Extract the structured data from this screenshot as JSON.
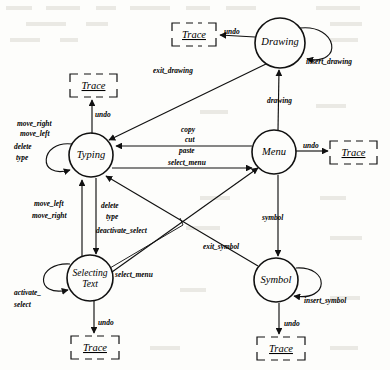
{
  "diagram": {
    "type": "state-machine",
    "states": [
      {
        "id": "drawing",
        "label": "Drawing",
        "label2": "",
        "cx": 280,
        "cy": 43,
        "r": 25
      },
      {
        "id": "typing",
        "label": "Typing",
        "label2": "",
        "cx": 91,
        "cy": 155,
        "r": 22
      },
      {
        "id": "menu",
        "label": "Menu",
        "label2": "",
        "cx": 274,
        "cy": 152,
        "r": 22
      },
      {
        "id": "selecting",
        "label": "Selecting",
        "label2": "Text",
        "cx": 90,
        "cy": 278,
        "r": 23
      },
      {
        "id": "symbol",
        "label": "Symbol",
        "label2": "",
        "cx": 276,
        "cy": 280,
        "r": 22
      }
    ],
    "traces": [
      {
        "id": "trace-drawing",
        "label": "Trace",
        "x": 172,
        "y": 23,
        "w": 44,
        "h": 23
      },
      {
        "id": "trace-typing",
        "label": "Trace",
        "x": 70,
        "y": 74,
        "w": 47,
        "h": 23
      },
      {
        "id": "trace-menu",
        "label": "Trace",
        "x": 330,
        "y": 141,
        "w": 47,
        "h": 23
      },
      {
        "id": "trace-selecting",
        "label": "Trace",
        "x": 71,
        "y": 336,
        "w": 48,
        "h": 23
      },
      {
        "id": "trace-symbol",
        "label": "Trace",
        "x": 257,
        "y": 337,
        "w": 48,
        "h": 23
      }
    ],
    "transitions": [
      {
        "id": "t-drawing-undo",
        "label": "undo"
      },
      {
        "id": "t-insert-drawing",
        "label": "insert_drawing"
      },
      {
        "id": "t-exit-drawing",
        "label": "exit_drawing"
      },
      {
        "id": "t-drawing",
        "label": "drawing"
      },
      {
        "id": "t-typing-undo",
        "label": "undo"
      },
      {
        "id": "t-move-right-top",
        "label": "move_right"
      },
      {
        "id": "t-move-left-top",
        "label": "move_left"
      },
      {
        "id": "t-delete-top",
        "label": "delete"
      },
      {
        "id": "t-type-top",
        "label": "type"
      },
      {
        "id": "t-copy",
        "label": "copy"
      },
      {
        "id": "t-cut",
        "label": "cut"
      },
      {
        "id": "t-paste",
        "label": "paste"
      },
      {
        "id": "t-select-menu-top",
        "label": "select_menu"
      },
      {
        "id": "t-menu-undo",
        "label": "undo"
      },
      {
        "id": "t-move-left-bot",
        "label": "move_left"
      },
      {
        "id": "t-move-right-bot",
        "label": "move_right"
      },
      {
        "id": "t-delete-bot",
        "label": "delete"
      },
      {
        "id": "t-type-bot",
        "label": "type"
      },
      {
        "id": "t-deactivate-select",
        "label": "deactivate_select"
      },
      {
        "id": "t-select-menu-bot",
        "label": "select_menu"
      },
      {
        "id": "t-activate-select",
        "label": "activate_"
      },
      {
        "id": "t-activate-select-2",
        "label": "select"
      },
      {
        "id": "t-selecting-undo",
        "label": "undo"
      },
      {
        "id": "t-symbol",
        "label": "symbol"
      },
      {
        "id": "t-exit-symbol",
        "label": "exit_symbol"
      },
      {
        "id": "t-insert-symbol",
        "label": "insert_symbol"
      },
      {
        "id": "t-symbol-undo",
        "label": "undo"
      }
    ],
    "colors": {
      "stroke": "#111111",
      "text": "#000000",
      "background": "#fdfdfb"
    }
  }
}
